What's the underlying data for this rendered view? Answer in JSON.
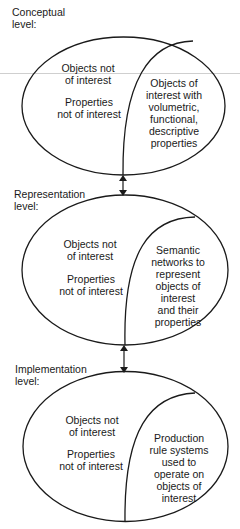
{
  "diagram": {
    "levels": [
      {
        "title": "Conceptual\nlevel:",
        "outside_region": {
          "objects": "Objects not\nof interest",
          "properties": "Properties\nnot of interest"
        },
        "inside_region": "Objects of\ninterest with\nvolumetric,\nfunctional,\ndescriptive\nproperties"
      },
      {
        "title": "Representation\nlevel:",
        "outside_region": {
          "objects": "Objects not\nof interest",
          "properties": "Properties\nnot of interest"
        },
        "inside_region": "Semantic\nnetworks to\nrepresent\nobjects of\ninterest\nand their\nproperties"
      },
      {
        "title": "Implementation\nlevel:",
        "outside_region": {
          "objects": "Objects not\nof interest",
          "properties": "Properties\nnot of interest"
        },
        "inside_region": "Production\nrule systems\nused to\noperate on\nobjects of\ninterest"
      }
    ],
    "connectors": [
      {
        "from": "Conceptual level",
        "to": "Representation level",
        "type": "double-headed-arrow"
      },
      {
        "from": "Representation level",
        "to": "Implementation level",
        "type": "double-headed-arrow"
      }
    ],
    "colors": {
      "stroke": "#1a1a1a",
      "background": "#ffffff"
    }
  }
}
